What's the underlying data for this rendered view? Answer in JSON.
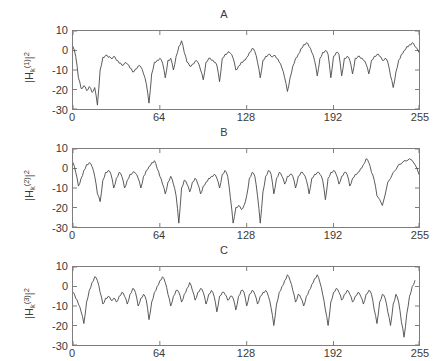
{
  "figure": {
    "background_color": "#ffffff",
    "axis_color": "#7d7d7d",
    "line_color": "#4a4a4a",
    "text_color": "#3a3a3a",
    "xlabel": "k"
  },
  "panels": [
    {
      "title": "A",
      "ylabel_parts": {
        "pre": "|H",
        "sub": "k",
        "sup": "(1)",
        "post": "|",
        "exp": "2"
      }
    },
    {
      "title": "B",
      "ylabel_parts": {
        "pre": "|H",
        "sub": "k",
        "sup": "(2)",
        "post": "|",
        "exp": "2"
      }
    },
    {
      "title": "C",
      "ylabel_parts": {
        "pre": "|H",
        "sub": "k",
        "sup": "(3)",
        "post": "|",
        "exp": "2"
      }
    }
  ],
  "chart_data": {
    "type": "line",
    "title": "",
    "xlabel": "k",
    "xlim": [
      0,
      255
    ],
    "ylim": [
      -30,
      10
    ],
    "xticks": [
      0,
      64,
      128,
      192,
      255
    ],
    "xticklabels": [
      "0",
      "64",
      "128",
      "192",
      "255"
    ],
    "yticks": [
      10,
      0,
      -10,
      -20,
      -30
    ],
    "yticklabels": [
      "10",
      "0",
      "-10",
      "-20",
      "-30"
    ],
    "grid": false,
    "legend": null,
    "subplots": [
      {
        "title": "A",
        "ylabel": "|H_k^(1)|^2",
        "x": [
          0,
          2,
          4,
          6,
          8,
          10,
          12,
          14,
          16,
          18,
          20,
          22,
          24,
          26,
          28,
          30,
          32,
          34,
          36,
          38,
          40,
          42,
          44,
          46,
          48,
          50,
          52,
          54,
          56,
          58,
          60,
          62,
          64,
          66,
          68,
          70,
          72,
          74,
          76,
          78,
          80,
          82,
          84,
          86,
          88,
          90,
          92,
          94,
          96,
          98,
          100,
          102,
          104,
          106,
          108,
          110,
          112,
          114,
          116,
          118,
          120,
          122,
          124,
          126,
          128,
          130,
          132,
          134,
          136,
          138,
          140,
          142,
          144,
          146,
          148,
          150,
          152,
          154,
          156,
          158,
          160,
          162,
          164,
          166,
          168,
          170,
          172,
          174,
          176,
          178,
          180,
          182,
          184,
          186,
          188,
          190,
          192,
          194,
          196,
          198,
          200,
          202,
          204,
          206,
          208,
          210,
          212,
          214,
          216,
          218,
          220,
          222,
          224,
          226,
          228,
          230,
          232,
          234,
          236,
          238,
          240,
          242,
          244,
          246,
          248,
          250,
          252,
          255
        ],
        "values": [
          2,
          -3,
          -14,
          -19.5,
          -18,
          -20.5,
          -18.5,
          -21.5,
          -19,
          -28,
          -10,
          -3.5,
          -2.5,
          -3.5,
          -4,
          -3,
          -5,
          -6.5,
          -7.5,
          -6.5,
          -7,
          -9,
          -11,
          -9.5,
          -8,
          -8.5,
          -12,
          -17,
          -27,
          -12,
          -6,
          -5,
          -4,
          -6.5,
          -14,
          -5,
          -4,
          -10,
          -3,
          2,
          5,
          -1,
          -6,
          -8,
          -7,
          -5.5,
          -6,
          -10,
          -15,
          -6,
          -4,
          -5,
          -6,
          -7.5,
          -16,
          -4,
          -2,
          -1,
          -1.5,
          -4,
          -10,
          -8,
          -6,
          -5,
          -3.5,
          -1,
          1,
          -0.5,
          -6,
          -14,
          -5,
          -3,
          -2,
          -3,
          -2.5,
          -4,
          -6,
          -9,
          -14,
          -21,
          -14,
          -8,
          -4,
          -2,
          1,
          3,
          4,
          2,
          -1,
          -5,
          -13,
          -4,
          -1,
          0,
          -2,
          -14,
          -3,
          -1,
          -2,
          -13,
          -4,
          -3,
          -5,
          -12,
          -4,
          -3,
          -4,
          -5,
          -7,
          -12,
          -5,
          -3,
          -2,
          -3,
          -5,
          -4,
          -6,
          -13,
          -19,
          -11,
          -5,
          -2,
          0,
          2,
          3,
          4,
          2,
          -1,
          3
        ]
      },
      {
        "title": "B",
        "ylabel": "|H_k^(2)|^2",
        "x": [
          0,
          2,
          4,
          6,
          8,
          10,
          12,
          14,
          16,
          18,
          20,
          22,
          24,
          26,
          28,
          30,
          32,
          34,
          36,
          38,
          40,
          42,
          44,
          46,
          48,
          50,
          52,
          54,
          56,
          58,
          60,
          62,
          64,
          66,
          68,
          70,
          72,
          74,
          76,
          78,
          80,
          82,
          84,
          86,
          88,
          90,
          92,
          94,
          96,
          98,
          100,
          102,
          104,
          106,
          108,
          110,
          112,
          114,
          116,
          118,
          120,
          122,
          124,
          126,
          128,
          130,
          132,
          134,
          136,
          138,
          140,
          142,
          144,
          146,
          148,
          150,
          152,
          154,
          156,
          158,
          160,
          162,
          164,
          166,
          168,
          170,
          172,
          174,
          176,
          178,
          180,
          182,
          184,
          186,
          188,
          190,
          192,
          194,
          196,
          198,
          200,
          202,
          204,
          206,
          208,
          210,
          212,
          214,
          216,
          218,
          220,
          222,
          224,
          228,
          232,
          236,
          240,
          244,
          248,
          252,
          255
        ],
        "values": [
          3,
          -2,
          -9,
          -5,
          -1,
          2,
          3,
          1,
          -4,
          -13,
          -17,
          -6,
          -2,
          -1,
          -3,
          -10,
          -5,
          -2,
          -4,
          -10,
          -6,
          -3,
          -2,
          -2.5,
          -5,
          -10,
          -4,
          -1,
          1,
          3,
          4,
          0,
          -4,
          -8,
          -13,
          -7,
          -4,
          -8,
          -14,
          -28,
          -10,
          -6,
          -8,
          -12,
          -7,
          -5,
          -8,
          -13,
          -9,
          -7,
          -5,
          -4,
          -3,
          -5,
          -10,
          -3,
          -1,
          -4,
          -15,
          -28,
          -20,
          -19,
          -21,
          -19,
          -14,
          -5,
          -2,
          -4,
          -14,
          -28,
          -12,
          -4,
          -1,
          -3,
          -13,
          -5,
          -2,
          -4,
          -8,
          -4,
          -3,
          -4,
          -10,
          -4,
          -2,
          -3,
          -6,
          -13,
          -5,
          -3,
          -2,
          -3,
          -6,
          -16,
          -5,
          -2,
          -1,
          -3,
          -8,
          -4,
          -2,
          -3,
          -9,
          -5,
          -3,
          -2,
          0,
          2,
          5,
          3,
          -2,
          -6,
          -14,
          -19,
          -7,
          -2,
          2,
          4,
          5,
          2,
          -3,
          -9,
          -17,
          -7,
          -1
        ]
      },
      {
        "title": "C",
        "ylabel": "|H_k^(3)|^2",
        "x": [
          0,
          2,
          4,
          6,
          8,
          10,
          12,
          14,
          16,
          18,
          20,
          22,
          24,
          26,
          28,
          30,
          32,
          34,
          36,
          38,
          40,
          42,
          44,
          46,
          48,
          50,
          52,
          54,
          56,
          58,
          60,
          62,
          64,
          66,
          68,
          70,
          72,
          74,
          76,
          78,
          80,
          82,
          84,
          86,
          88,
          90,
          92,
          94,
          96,
          98,
          100,
          102,
          104,
          106,
          108,
          110,
          112,
          114,
          116,
          118,
          120,
          122,
          124,
          126,
          128,
          130,
          132,
          134,
          136,
          138,
          140,
          142,
          144,
          146,
          148,
          150,
          152,
          154,
          156,
          158,
          160,
          162,
          164,
          166,
          168,
          170,
          172,
          174,
          176,
          178,
          180,
          182,
          184,
          186,
          188,
          190,
          192,
          194,
          196,
          198,
          200,
          202,
          204,
          206,
          208,
          210,
          212,
          214,
          216,
          218,
          220,
          222,
          224,
          226,
          228,
          230,
          232,
          234,
          236,
          238,
          240,
          242,
          244,
          246,
          248,
          250,
          252,
          255
        ],
        "values": [
          -3,
          -6,
          -9,
          -13,
          -19,
          -8,
          -2,
          2,
          5,
          3,
          -3,
          -9,
          -6,
          -5,
          -7,
          -6,
          -8,
          -5,
          -3,
          -5,
          -9,
          -4,
          -1,
          -3,
          -10,
          -6,
          -4,
          -7,
          -17,
          -8,
          -3,
          0,
          3,
          5,
          2,
          -4,
          -10,
          -5,
          -2,
          -3,
          -8,
          -4,
          -1,
          2,
          -2,
          -7,
          -3,
          -1,
          -3,
          -9,
          -4,
          -2,
          -5,
          -13,
          -5,
          -3,
          -4,
          -7,
          -5,
          -6,
          -12,
          -5,
          -2,
          -3,
          -10,
          -4,
          -2,
          -4,
          -9,
          -5,
          -3,
          -2,
          -5,
          -11,
          -20,
          -9,
          -3,
          0,
          3,
          6,
          3,
          -2,
          -8,
          -4,
          -6,
          -10,
          -5,
          -2,
          1,
          4,
          6,
          2,
          -4,
          -12,
          -20,
          -8,
          -3,
          -1,
          -3,
          -7,
          -4,
          -2,
          -4,
          -8,
          -5,
          -3,
          -5,
          -9,
          -4,
          -2,
          -4,
          -12,
          -19,
          -8,
          -4,
          -6,
          -13,
          -20,
          -9,
          -4,
          -8,
          -18,
          -26,
          -14,
          -5,
          0,
          3
        ]
      }
    ]
  }
}
